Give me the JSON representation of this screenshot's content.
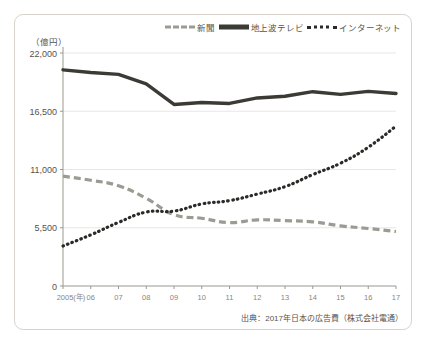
{
  "figure": {
    "unit_label": "（億円）",
    "source_note": "出典：2017年日本の広告費（株式会社電通）"
  },
  "legend": {
    "position": "top-right",
    "items": [
      {
        "label": "新聞",
        "style": "dashed",
        "color": "#9b9b93"
      },
      {
        "label": "地上波テレビ",
        "style": "solid",
        "color": "#3b3a35"
      },
      {
        "label": "インターネット",
        "style": "dotted",
        "color": "#2b2a26"
      }
    ]
  },
  "chart_data": {
    "type": "line",
    "title": "",
    "xlabel": "",
    "ylabel": "億円",
    "categories": [
      "2005(年)",
      "06",
      "07",
      "08",
      "09",
      "10",
      "11",
      "12",
      "13",
      "14",
      "15",
      "16",
      "17"
    ],
    "x_tick_labels": [
      "2005(年)",
      "06",
      "07",
      "08",
      "09",
      "10",
      "11",
      "12",
      "13",
      "14",
      "15",
      "16",
      "17"
    ],
    "y_tick_labels": [
      "0",
      "5,500",
      "11,000",
      "16,500",
      "22,000"
    ],
    "y_ticks": [
      0,
      5500,
      11000,
      16500,
      22000
    ],
    "ylim": [
      0,
      22000
    ],
    "grid": true,
    "legend_position": "top-right",
    "series": [
      {
        "name": "新聞",
        "style": "dashed",
        "color": "#9b9b93",
        "values": [
          10377,
          9986,
          9462,
          8276,
          6739,
          6396,
          5990,
          6242,
          6170,
          6057,
          5679,
          5431,
          5147
        ]
      },
      {
        "name": "地上波テレビ",
        "style": "solid",
        "color": "#3b3a35",
        "values": [
          20411,
          20161,
          19981,
          19092,
          17139,
          17321,
          17237,
          17757,
          17913,
          18347,
          18088,
          18374,
          18178
        ]
      },
      {
        "name": "インターネット",
        "style": "dotted",
        "color": "#2b2a26",
        "values": [
          3777,
          4826,
          6003,
          6983,
          7069,
          7747,
          8062,
          8680,
          9381,
          10519,
          11594,
          13100,
          15094
        ]
      }
    ]
  }
}
